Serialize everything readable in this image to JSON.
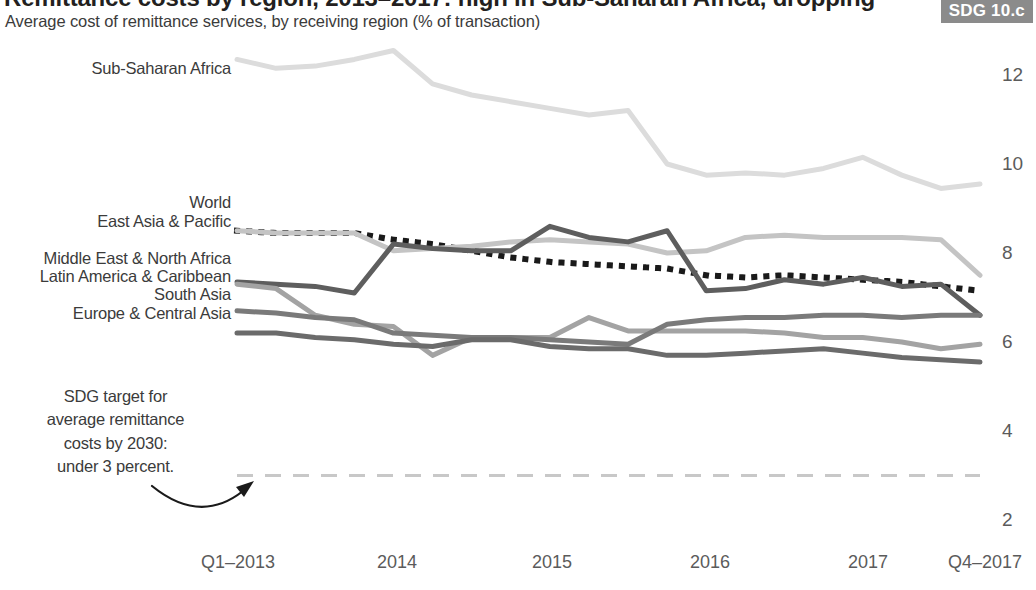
{
  "header": {
    "title": "Remittance costs by region, 2013–2017: high in Sub-Saharan Africa, dropping",
    "subtitle": "Average cost of remittance services, by receiving region (% of transaction)",
    "badge": "SDG 10.c"
  },
  "annotation": {
    "line1": "SDG target for",
    "line2": "average remittance",
    "line3": "costs by 2030:",
    "line4": "under 3 percent."
  },
  "series_labels": {
    "sub_saharan_africa": "Sub-Saharan Africa",
    "world": "World",
    "east_asia_pacific": "East Asia & Pacific",
    "middle_east_north_africa": "Middle East & North Africa",
    "latin_america_caribbean": "Latin America & Caribbean",
    "south_asia": "South Asia",
    "europe_central_asia": "Europe & Central Asia"
  },
  "chart_data": {
    "type": "line",
    "title": "Remittance costs by region, 2013–2017: high in Sub-Saharan Africa, dropping",
    "subtitle": "Average cost of remittance services, by receiving region (% of transaction)",
    "xlabel": "",
    "ylabel": "% of transaction",
    "ylim": [
      2,
      13
    ],
    "yticks": [
      2,
      4,
      6,
      8,
      10,
      12
    ],
    "grid": false,
    "legend_position": "left-inline-labels",
    "x_tick_labels": [
      "Q1–2013",
      "2014",
      "2015",
      "2016",
      "2017",
      "Q4–2017"
    ],
    "x_tick_positions": [
      0,
      4,
      8,
      12,
      16,
      19
    ],
    "x": [
      "Q1-2013",
      "Q2-2013",
      "Q3-2013",
      "Q4-2013",
      "Q1-2014",
      "Q2-2014",
      "Q3-2014",
      "Q4-2014",
      "Q1-2015",
      "Q2-2015",
      "Q3-2015",
      "Q4-2015",
      "Q1-2016",
      "Q2-2016",
      "Q3-2016",
      "Q4-2016",
      "Q1-2017",
      "Q2-2017",
      "Q3-2017",
      "Q4-2017"
    ],
    "series": [
      {
        "name": "Sub-Saharan Africa",
        "color": "#dcdcdc",
        "style": "solid",
        "width": 5,
        "values": [
          12.35,
          12.15,
          12.2,
          12.35,
          12.55,
          11.8,
          11.55,
          11.4,
          11.25,
          11.1,
          11.2,
          10.0,
          9.75,
          9.8,
          9.75,
          9.9,
          10.15,
          9.75,
          9.45,
          9.55
        ]
      },
      {
        "name": "World",
        "color": "#1a1a1a",
        "style": "dotted",
        "width": 5,
        "values": [
          8.5,
          8.45,
          8.45,
          8.45,
          8.3,
          8.2,
          8.05,
          7.9,
          7.8,
          7.75,
          7.7,
          7.65,
          7.5,
          7.45,
          7.5,
          7.45,
          7.4,
          7.35,
          7.25,
          7.15
        ]
      },
      {
        "name": "East Asia & Pacific",
        "color": "#c4c4c4",
        "style": "solid",
        "width": 5,
        "values": [
          8.5,
          8.45,
          8.45,
          8.45,
          8.05,
          8.1,
          8.15,
          8.25,
          8.3,
          8.25,
          8.2,
          8.0,
          8.05,
          8.35,
          8.4,
          8.35,
          8.35,
          8.35,
          8.3,
          7.5
        ]
      },
      {
        "name": "Middle East & North Africa",
        "color": "#5e5e5e",
        "style": "solid",
        "width": 5,
        "values": [
          7.35,
          7.3,
          7.25,
          7.1,
          8.2,
          8.1,
          8.05,
          8.05,
          8.6,
          8.35,
          8.25,
          8.5,
          7.15,
          7.2,
          7.4,
          7.3,
          7.45,
          7.25,
          7.3,
          6.6
        ]
      },
      {
        "name": "Latin America & Caribbean",
        "color": "#a3a3a3",
        "style": "solid",
        "width": 5,
        "values": [
          7.3,
          7.2,
          6.6,
          6.4,
          6.35,
          5.7,
          6.1,
          6.1,
          6.1,
          6.55,
          6.25,
          6.25,
          6.25,
          6.25,
          6.2,
          6.1,
          6.1,
          6.0,
          5.85,
          5.95
        ]
      },
      {
        "name": "South Asia",
        "color": "#7a7a7a",
        "style": "solid",
        "width": 5,
        "values": [
          6.7,
          6.65,
          6.55,
          6.5,
          6.2,
          6.15,
          6.1,
          6.1,
          6.05,
          6.0,
          5.95,
          6.4,
          6.5,
          6.55,
          6.55,
          6.6,
          6.6,
          6.55,
          6.6,
          6.6
        ]
      },
      {
        "name": "Europe & Central Asia",
        "color": "#6b6b6b",
        "style": "solid",
        "width": 5,
        "values": [
          6.2,
          6.2,
          6.1,
          6.05,
          5.95,
          5.9,
          6.05,
          6.05,
          5.9,
          5.85,
          5.85,
          5.7,
          5.7,
          5.75,
          5.8,
          5.85,
          5.75,
          5.65,
          5.6,
          5.55
        ]
      },
      {
        "name": "SDG target",
        "color": "#c8c8c8",
        "style": "dashed",
        "width": 3,
        "values": [
          3,
          3,
          3,
          3,
          3,
          3,
          3,
          3,
          3,
          3,
          3,
          3,
          3,
          3,
          3,
          3,
          3,
          3,
          3,
          3
        ]
      }
    ]
  }
}
